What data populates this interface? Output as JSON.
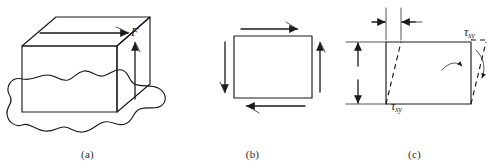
{
  "figure": {
    "panels": [
      {
        "id": "a",
        "caption": "(a)",
        "description": "Rectangular block bonded to a surface with shear force applied to top face",
        "labels": [
          {
            "name": "shear-force",
            "text": "F",
            "symbol": "F"
          }
        ]
      },
      {
        "id": "b",
        "caption": "(b)",
        "description": "Plane element with shear stresses on all four faces",
        "labels": [
          {
            "name": "shear-stress-top-right",
            "symbol": "τ",
            "sub": "xy"
          },
          {
            "name": "shear-stress-bottom-left",
            "symbol": "τ",
            "sub": "xy"
          }
        ]
      },
      {
        "id": "c",
        "caption": "(c)",
        "description": "Element deformed in shear showing shear strain angle",
        "labels": [
          {
            "name": "delta-x",
            "prefix": "Δ",
            "symbol": "x"
          },
          {
            "name": "height",
            "symbol": "h"
          },
          {
            "name": "shear-strain",
            "symbol": "γ",
            "sub": "xy"
          }
        ]
      }
    ]
  },
  "panel_a": {
    "caption": "(a)",
    "force_label": "F"
  },
  "panel_b": {
    "caption": "(b)",
    "tau_symbol": "τ",
    "tau_sub": "xy"
  },
  "panel_c": {
    "caption": "(c)",
    "delta_prefix": "Δ",
    "delta_symbol": "x",
    "height_symbol": "h",
    "gamma_symbol": "γ",
    "gamma_sub": "xy"
  },
  "colors": {
    "ink": "#1a1a1a",
    "thin_ink": "#2b2b2b",
    "background": "#ffffff"
  }
}
